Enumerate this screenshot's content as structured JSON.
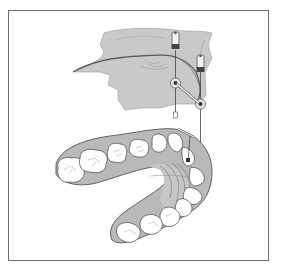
{
  "figure": {
    "colors": {
      "frame": "#6e6e6e",
      "tissue_fill": "#c8c8c8",
      "tissue_dark": "#a8a8a8",
      "outline": "#555555",
      "tooth_fill": "#ffffff",
      "background": "#ffffff"
    },
    "parts": {
      "maxilla": "upper-jaw-bone",
      "implants": [
        "implant-left",
        "implant-right"
      ],
      "screws": [
        "screw-left",
        "screw-right"
      ],
      "arch": "dental-arch",
      "indicator": "guide-pin"
    }
  }
}
